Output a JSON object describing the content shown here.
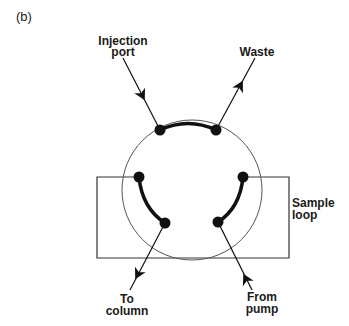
{
  "figure": {
    "panel_label": "(b)"
  },
  "labels": {
    "injection_port": [
      "Injection",
      "port"
    ],
    "waste": [
      "Waste"
    ],
    "sample_loop": [
      "Sample",
      "loop"
    ],
    "to_column": [
      "To",
      "column"
    ],
    "from_pump": [
      "From",
      "pump"
    ]
  },
  "valve": {
    "ports": 6,
    "connections": [
      {
        "from": "top-left",
        "to": "top-right",
        "meaning": "Injection port to Waste"
      },
      {
        "from": "left",
        "to": "bottom-left",
        "meaning": "Sample loop to column"
      },
      {
        "from": "right",
        "to": "bottom-right",
        "meaning": "Pump to sample loop"
      }
    ]
  },
  "colors": {
    "line": "#1a1a1a",
    "circle": "#555555",
    "background": "#ffffff"
  }
}
